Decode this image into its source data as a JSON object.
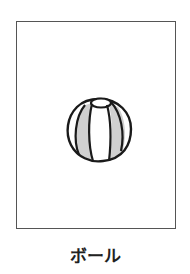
{
  "card": {
    "caption": "ボール",
    "illustration": {
      "subject": "beach-ball-icon",
      "colors": {
        "outline": "#1a1a1a",
        "panel_shaded": "#d0d0d0",
        "panel_white": "#ffffff",
        "frame": "#555555"
      }
    }
  }
}
